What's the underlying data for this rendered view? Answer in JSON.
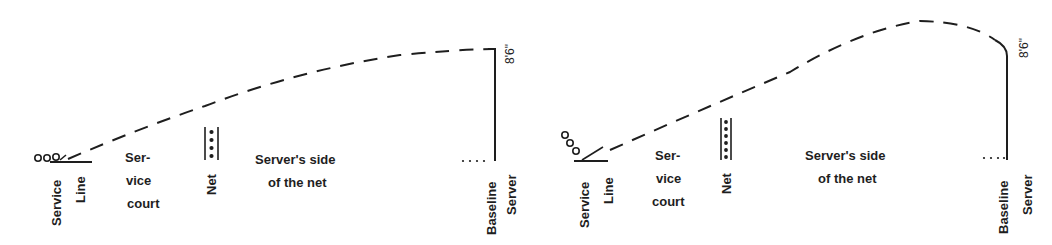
{
  "diagrams": [
    {
      "id": "left",
      "labels": {
        "service": "Service",
        "line": "Line",
        "service_court": [
          "Ser-",
          "vice",
          "court"
        ],
        "net": "Net",
        "servers_side": [
          "Server's side",
          "of the net"
        ],
        "baseline": "Baseline",
        "server": "Server",
        "height": "8'6\""
      }
    },
    {
      "id": "right",
      "labels": {
        "service": "Service",
        "line": "Line",
        "service_court": [
          "Ser-",
          "vice",
          "court"
        ],
        "net": "Net",
        "servers_side": [
          "Server's side",
          "of the net"
        ],
        "baseline": "Baseline",
        "server": "Server",
        "height": "8'6\""
      }
    }
  ],
  "colors": {
    "ink": "#1e1e1e",
    "background": "#ffffff"
  }
}
